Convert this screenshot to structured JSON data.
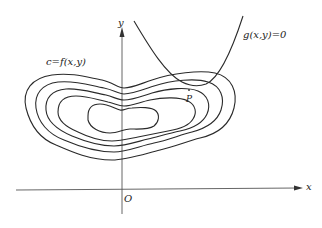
{
  "diagram": {
    "labels": {
      "level_curve": "c=f(x,y)",
      "constraint": "g(x,y)=0",
      "point": "P",
      "x_axis": "x",
      "y_axis": "y",
      "origin": "O"
    },
    "contour_count": 5,
    "colors": {
      "stroke": "#2a2a2a",
      "axis": "#555555",
      "background": "#ffffff"
    }
  }
}
